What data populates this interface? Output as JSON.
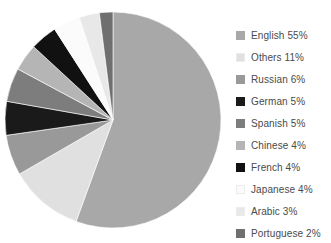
{
  "chart_data": {
    "type": "pie",
    "title": "",
    "xlabel": "",
    "ylabel": "",
    "legend_position": "right",
    "grid": false,
    "start_angle_deg": 0,
    "direction": "clockwise",
    "categories": [
      "English",
      "Others",
      "Russian",
      "German",
      "Spanish",
      "Chinese",
      "French",
      "Japanese",
      "Arabic",
      "Portuguese"
    ],
    "values": [
      55,
      11,
      6,
      5,
      5,
      4,
      4,
      4,
      3,
      2
    ],
    "unit": "%",
    "colors": [
      "#a8a8a8",
      "#e0e0e0",
      "#999999",
      "#1a1a1a",
      "#7d7d7d",
      "#b5b5b5",
      "#111111",
      "#fbfbfb",
      "#e8e8e8",
      "#6f6f6f"
    ],
    "slices": [
      {
        "label": "English",
        "value": 55,
        "display": "English 55%",
        "color": "#a8a8a8"
      },
      {
        "label": "Others",
        "value": 11,
        "display": "Others 11%",
        "color": "#e0e0e0"
      },
      {
        "label": "Russian",
        "value": 6,
        "display": "Russian 6%",
        "color": "#999999"
      },
      {
        "label": "German",
        "value": 5,
        "display": "German 5%",
        "color": "#1a1a1a"
      },
      {
        "label": "Spanish",
        "value": 5,
        "display": "Spanish 5%",
        "color": "#7d7d7d"
      },
      {
        "label": "Chinese",
        "value": 4,
        "display": "Chinese 4%",
        "color": "#b5b5b5"
      },
      {
        "label": "French",
        "value": 4,
        "display": "French 4%",
        "color": "#111111"
      },
      {
        "label": "Japanese",
        "value": 4,
        "display": "Japanese 4%",
        "color": "#fbfbfb"
      },
      {
        "label": "Arabic",
        "value": 3,
        "display": "Arabic 3%",
        "color": "#e8e8e8"
      },
      {
        "label": "Portuguese",
        "value": 2,
        "display": "Portuguese 2%",
        "color": "#6f6f6f"
      }
    ]
  },
  "legend": {
    "items": [
      {
        "text": "English 55%"
      },
      {
        "text": "Others 11%"
      },
      {
        "text": "Russian 6%"
      },
      {
        "text": "German 5%"
      },
      {
        "text": "Spanish 5%"
      },
      {
        "text": "Chinese 4%"
      },
      {
        "text": "French 4%"
      },
      {
        "text": "Japanese 4%"
      },
      {
        "text": "Arabic 3%"
      },
      {
        "text": "Portuguese 2%"
      }
    ]
  },
  "geometry": {
    "center_x": 113,
    "center_y": 120,
    "radius": 108
  }
}
